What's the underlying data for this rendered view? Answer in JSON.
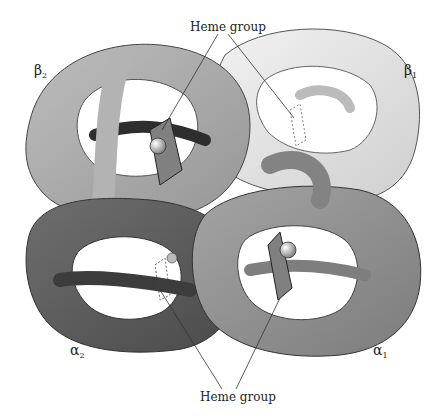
{
  "labels": {
    "heme_top": "Heme group",
    "heme_bottom": "Heme group",
    "beta2": {
      "symbol": "β",
      "sub": "2"
    },
    "beta1": {
      "symbol": "β",
      "sub": "1"
    },
    "alpha2": {
      "symbol": "α",
      "sub": "2"
    },
    "alpha1": {
      "symbol": "α",
      "sub": "1"
    }
  },
  "colors": {
    "beta1": "#e2e2e2",
    "beta2": "#a9a9a9",
    "alpha1": "#8e8e8e",
    "alpha2": "#5e5e5e",
    "heme": "#7a7a7a",
    "outline": "#333333",
    "background": "#ffffff"
  }
}
